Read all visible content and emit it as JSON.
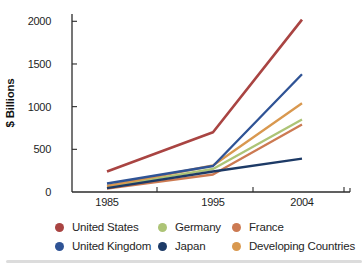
{
  "chart_data": {
    "type": "line",
    "title": "",
    "ylabel": "$ Billions",
    "xlabel": "",
    "x": [
      1985,
      1995,
      2004
    ],
    "x_labels": [
      "1985",
      "1995",
      "2004"
    ],
    "ylim": [
      0,
      2000
    ],
    "yticks": [
      0,
      500,
      1000,
      1500,
      2000
    ],
    "grid": false,
    "legend_position": "bottom",
    "series": [
      {
        "name": "United States",
        "color": "#a94442",
        "values": [
          240,
          700,
          2020
        ]
      },
      {
        "name": "United Kingdom",
        "color": "#2f5395",
        "values": [
          100,
          305,
          1380
        ]
      },
      {
        "name": "Developing Countries",
        "color": "#d9984f",
        "values": [
          70,
          310,
          1040
        ]
      },
      {
        "name": "Germany",
        "color": "#adc476",
        "values": [
          60,
          270,
          850
        ]
      },
      {
        "name": "France",
        "color": "#cc7a52",
        "values": [
          40,
          205,
          790
        ]
      },
      {
        "name": "Japan",
        "color": "#1d3a66",
        "values": [
          45,
          240,
          390
        ]
      }
    ],
    "legend_order": [
      "United States",
      "Germany",
      "France",
      "United Kingdom",
      "Japan",
      "Developing Countries"
    ]
  }
}
